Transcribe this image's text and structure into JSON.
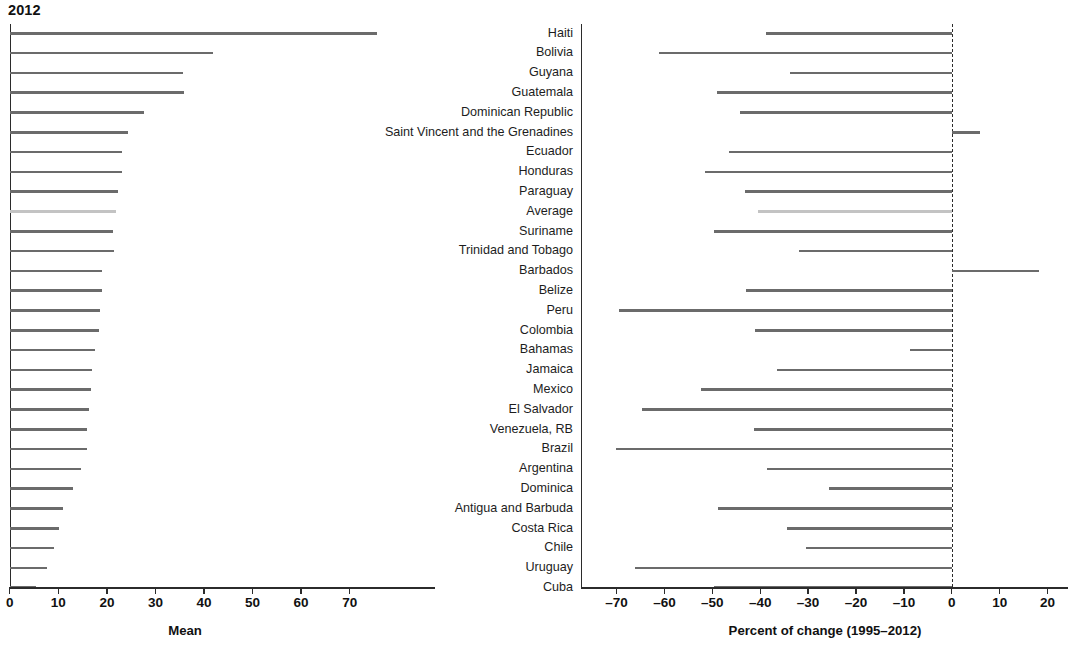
{
  "chart": {
    "title": "2012",
    "left_axis_title": "Mean",
    "right_axis_title": "Percent of change (1995–2012)"
  },
  "axes": {
    "left_ticks": [
      "0",
      "10",
      "20",
      "30",
      "40",
      "50",
      "60",
      "70"
    ],
    "right_ticks": [
      "–70",
      "–60",
      "–50",
      "–40",
      "–30",
      "–20",
      "–10",
      "0",
      "10",
      "20"
    ]
  },
  "colors": {
    "bar": "#6b6b6b",
    "average_bar": "#c3c3c3",
    "axis": "#2b2b2b",
    "text": "#1a1a1a"
  },
  "chart_data": {
    "type": "bar",
    "title": "2012",
    "xlabel": "Mean",
    "xlabel2": "Percent of change (1995–2012)",
    "ylabel": "",
    "grid": false,
    "legend": "none",
    "orientation": "horizontal",
    "panels": [
      {
        "name": "Mean",
        "xlim": [
          0,
          77
        ],
        "ticks": [
          0,
          10,
          20,
          30,
          40,
          50,
          60,
          70
        ]
      },
      {
        "name": "Percent of change (1995–2012)",
        "xlim": [
          -75,
          23
        ],
        "ticks": [
          -70,
          -60,
          -50,
          -40,
          -30,
          -20,
          -10,
          0,
          10,
          20
        ],
        "zero_reference_line": 0
      }
    ],
    "categories": [
      "Haiti",
      "Bolivia",
      "Guyana",
      "Guatemala",
      "Dominican Republic",
      "Saint Vincent and the Grenadines",
      "Ecuador",
      "Honduras",
      "Paraguay",
      "Average",
      "Suriname",
      "Trinidad and Tobago",
      "Barbados",
      "Belize",
      "Peru",
      "Colombia",
      "Bahamas",
      "Jamaica",
      "Mexico",
      "El Salvador",
      "Venezuela, RB",
      "Brazil",
      "Argentina",
      "Dominica",
      "Antigua and Barbuda",
      "Costa Rica",
      "Chile",
      "Uruguay",
      "Cuba"
    ],
    "series": [
      {
        "name": "Mean",
        "values": [
          75.7,
          41.9,
          35.7,
          35.9,
          27.6,
          24.4,
          23.2,
          23.2,
          22.2,
          21.8,
          21.2,
          21.4,
          19.0,
          19.0,
          18.6,
          18.4,
          17.6,
          17.0,
          16.8,
          16.4,
          16.0,
          16.0,
          14.6,
          13.0,
          11.0,
          10.2,
          9.2,
          7.6,
          5.4
        ]
      },
      {
        "name": "Percent of change (1995-2012)",
        "values": [
          -38.8,
          -61.2,
          -33.8,
          -49.0,
          -44.2,
          5.8,
          -46.6,
          -51.6,
          -43.2,
          -40.4,
          -49.6,
          -32.0,
          18.2,
          -43.0,
          -69.4,
          -41.0,
          -8.8,
          -36.4,
          -52.4,
          -64.6,
          -41.2,
          -70.2,
          -38.6,
          -25.6,
          -48.8,
          -34.4,
          -30.4,
          -66.2,
          -49.6
        ]
      }
    ],
    "highlighted_category": "Average"
  }
}
